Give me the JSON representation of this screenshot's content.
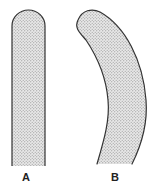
{
  "figure": {
    "shapes": [
      {
        "id": "A",
        "label": "A",
        "description": "straight rounded-top strip",
        "label_x": 26,
        "label_y": 181
      },
      {
        "id": "B",
        "label": "B",
        "description": "curved rounded-top strip",
        "label_x": 115,
        "label_y": 181
      }
    ],
    "colors": {
      "stroke": "#333333",
      "fill_base": "#e6e6e6",
      "dot": "#8a8a8a",
      "background": "#ffffff",
      "label": "#222222"
    }
  }
}
